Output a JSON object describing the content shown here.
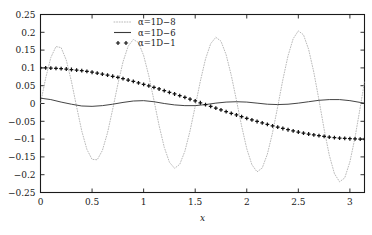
{
  "figure": {
    "background": "#ffffff",
    "frame_color": "#1a1a1a",
    "axis_label_x": "x",
    "axis_label_y": ""
  },
  "legend": {
    "position": "top-right-inside",
    "entries": [
      {
        "marker": "dotted-line",
        "label": "α=1D−8",
        "color": "#b9b9b9"
      },
      {
        "marker": "solid-line",
        "label": "α=1D−6",
        "color": "#3a3a3a"
      },
      {
        "marker": "plus-plus",
        "label": "α=1D−1",
        "color": "#111111"
      }
    ]
  },
  "chart_data": {
    "type": "line",
    "title": "",
    "xlabel": "x",
    "ylabel": "",
    "xlim": [
      0,
      3.14159265
    ],
    "ylim": [
      -0.25,
      0.25
    ],
    "grid": false,
    "xticks": [
      0,
      0.5,
      1,
      1.5,
      2,
      2.5,
      3
    ],
    "xticklabels": [
      "0",
      "0.5",
      "1",
      "1.5",
      "2",
      "2.5",
      "3"
    ],
    "yticks": [
      -0.25,
      -0.2,
      -0.15,
      -0.1,
      -0.05,
      0,
      0.05,
      0.1,
      0.15,
      0.2,
      0.25
    ],
    "yticklabels": [
      "−0.25",
      "−0.2",
      "−0.15",
      "−0.1",
      "−0.05",
      "0",
      "0.05",
      "0.1",
      "0.15",
      "0.2",
      "0.25"
    ],
    "series": [
      {
        "name": "α=1D−8",
        "style": "dotted",
        "color": "#b9b9b9",
        "description": "high-frequency oscillation, ~5 periods over [0,pi], amplitude growing from about 0.16 to 0.22",
        "x": [
          0.0,
          0.05,
          0.1,
          0.15,
          0.2,
          0.25,
          0.3,
          0.35,
          0.4,
          0.45,
          0.5,
          0.55,
          0.6,
          0.65,
          0.7,
          0.75,
          0.8,
          0.85,
          0.9,
          0.95,
          1.0,
          1.05,
          1.1,
          1.15,
          1.2,
          1.25,
          1.3,
          1.35,
          1.4,
          1.45,
          1.5,
          1.55,
          1.6,
          1.65,
          1.7,
          1.75,
          1.8,
          1.85,
          1.9,
          1.95,
          2.0,
          2.05,
          2.1,
          2.15,
          2.2,
          2.25,
          2.3,
          2.35,
          2.4,
          2.45,
          2.5,
          2.55,
          2.6,
          2.65,
          2.7,
          2.75,
          2.8,
          2.85,
          2.9,
          2.95,
          3.0,
          3.05,
          3.1,
          3.14159
        ],
        "y": [
          0.0,
          0.071,
          0.129,
          0.16,
          0.157,
          0.122,
          0.062,
          -0.009,
          -0.077,
          -0.129,
          -0.157,
          -0.158,
          -0.132,
          -0.082,
          -0.016,
          0.054,
          0.117,
          0.161,
          0.18,
          0.171,
          0.135,
          0.078,
          0.009,
          -0.062,
          -0.123,
          -0.165,
          -0.182,
          -0.171,
          -0.134,
          -0.077,
          -0.008,
          0.063,
          0.125,
          0.168,
          0.186,
          0.175,
          0.137,
          0.079,
          0.009,
          -0.063,
          -0.127,
          -0.172,
          -0.192,
          -0.181,
          -0.142,
          -0.082,
          -0.009,
          0.067,
          0.134,
          0.182,
          0.204,
          0.193,
          0.152,
          0.088,
          0.01,
          -0.072,
          -0.145,
          -0.197,
          -0.22,
          -0.209,
          -0.164,
          -0.095,
          -0.011,
          0.061
        ]
      },
      {
        "name": "α=1D−6",
        "style": "solid",
        "color": "#3a3a3a",
        "description": "low-amplitude ripple around zero, same frequency, amplitude about 0.012",
        "x": [
          0.0,
          0.1,
          0.2,
          0.3,
          0.4,
          0.5,
          0.6,
          0.7,
          0.8,
          0.9,
          1.0,
          1.1,
          1.2,
          1.3,
          1.4,
          1.5,
          1.6,
          1.7,
          1.8,
          1.9,
          2.0,
          2.1,
          2.2,
          2.3,
          2.4,
          2.5,
          2.6,
          2.7,
          2.8,
          2.9,
          3.0,
          3.1,
          3.14159
        ],
        "y": [
          0.015,
          0.011,
          0.004,
          -0.002,
          -0.007,
          -0.008,
          -0.006,
          -0.002,
          0.003,
          0.007,
          0.008,
          0.005,
          0.0,
          -0.004,
          -0.006,
          -0.006,
          -0.003,
          0.001,
          0.004,
          0.005,
          0.004,
          0.001,
          -0.002,
          -0.003,
          -0.002,
          0.001,
          0.005,
          0.009,
          0.011,
          0.011,
          0.008,
          0.003,
          0.001
        ]
      },
      {
        "name": "α=1D−1",
        "style": "plus-markers",
        "color": "#111111",
        "description": "smooth cosine-like decay from 0.1 down to about -0.1",
        "x": [
          0.0,
          0.05,
          0.1,
          0.15,
          0.2,
          0.25,
          0.3,
          0.35,
          0.4,
          0.45,
          0.5,
          0.55,
          0.6,
          0.65,
          0.7,
          0.75,
          0.8,
          0.85,
          0.9,
          0.95,
          1.0,
          1.05,
          1.1,
          1.15,
          1.2,
          1.25,
          1.3,
          1.35,
          1.4,
          1.45,
          1.5,
          1.55,
          1.6,
          1.65,
          1.7,
          1.75,
          1.8,
          1.85,
          1.9,
          1.95,
          2.0,
          2.05,
          2.1,
          2.15,
          2.2,
          2.25,
          2.3,
          2.35,
          2.4,
          2.45,
          2.5,
          2.55,
          2.6,
          2.65,
          2.7,
          2.75,
          2.8,
          2.85,
          2.9,
          2.95,
          3.0,
          3.05,
          3.1,
          3.14159
        ],
        "y": [
          0.1,
          0.0999,
          0.0995,
          0.0989,
          0.098,
          0.0969,
          0.0955,
          0.0939,
          0.0921,
          0.09,
          0.0878,
          0.0853,
          0.0825,
          0.0796,
          0.0765,
          0.0732,
          0.0697,
          0.066,
          0.0622,
          0.0582,
          0.054,
          0.0498,
          0.0454,
          0.0408,
          0.0362,
          0.0315,
          0.0267,
          0.0219,
          0.017,
          0.012,
          0.0071,
          0.0021,
          -0.0029,
          -0.0079,
          -0.0129,
          -0.0178,
          -0.0227,
          -0.0276,
          -0.0323,
          -0.037,
          -0.0416,
          -0.0461,
          -0.0505,
          -0.0547,
          -0.0589,
          -0.0628,
          -0.0666,
          -0.0702,
          -0.0737,
          -0.0769,
          -0.0801,
          -0.083,
          -0.0857,
          -0.0882,
          -0.0904,
          -0.0925,
          -0.0942,
          -0.0958,
          -0.0971,
          -0.0982,
          -0.099,
          -0.0996,
          -0.0999,
          -0.1
        ]
      }
    ]
  }
}
